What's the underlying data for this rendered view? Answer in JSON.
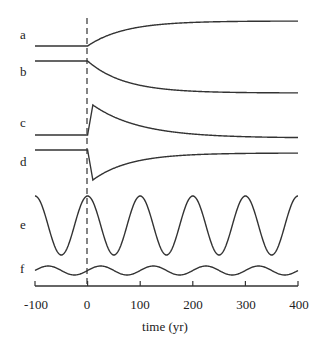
{
  "chart_data": {
    "type": "line",
    "title": "",
    "xlabel": "time (yr)",
    "ylabel": "",
    "xlim": [
      -100,
      400
    ],
    "x_ticks": [
      -100,
      0,
      100,
      200,
      300,
      400
    ],
    "grid": false,
    "annotations": [
      "vertical dashed line at t = 0"
    ],
    "series": [
      {
        "name": "a",
        "description": "constant before t=0, then rises monotonically toward a higher plateau",
        "x": [
          -100,
          0,
          50,
          100,
          200,
          300,
          400
        ],
        "y": [
          0,
          0,
          0.45,
          0.7,
          0.92,
          0.98,
          1.0
        ]
      },
      {
        "name": "b",
        "description": "constant before t=0, then decays monotonically toward a lower plateau",
        "x": [
          -100,
          0,
          50,
          100,
          200,
          300,
          400
        ],
        "y": [
          0,
          0,
          -0.45,
          -0.7,
          -0.92,
          -0.98,
          -1.0
        ]
      },
      {
        "name": "c",
        "description": "constant before t=0, sharp spike up just after t=0, then relaxes back near baseline (slightly below)",
        "x": [
          -100,
          0,
          10,
          50,
          100,
          200,
          300,
          400
        ],
        "y": [
          0,
          0,
          1.0,
          0.6,
          0.35,
          0.1,
          0.0,
          -0.1
        ]
      },
      {
        "name": "d",
        "description": "constant before t=0, sharp drop just after t=0, then recovers toward near baseline",
        "x": [
          -100,
          0,
          10,
          50,
          100,
          200,
          300,
          400
        ],
        "y": [
          0,
          0,
          -1.0,
          -0.6,
          -0.35,
          -0.2,
          -0.12,
          -0.1
        ]
      },
      {
        "name": "e",
        "description": "large-amplitude sinusoid, period ~100 yr, peak at t=0",
        "period": 100,
        "amplitude": 1.0,
        "phase_peak_at": 0
      },
      {
        "name": "f",
        "description": "small-amplitude sinusoid, period ~100 yr, peaks ~25 yr after e peaks",
        "period": 100,
        "amplitude": 0.15,
        "phase_peak_at": 25
      }
    ]
  },
  "labels": {
    "a": "a",
    "b": "b",
    "c": "c",
    "d": "d",
    "e": "e",
    "f": "f",
    "xlabel": "time (yr)",
    "ticks": [
      "-100",
      "0",
      "100",
      "200",
      "300",
      "400"
    ]
  }
}
